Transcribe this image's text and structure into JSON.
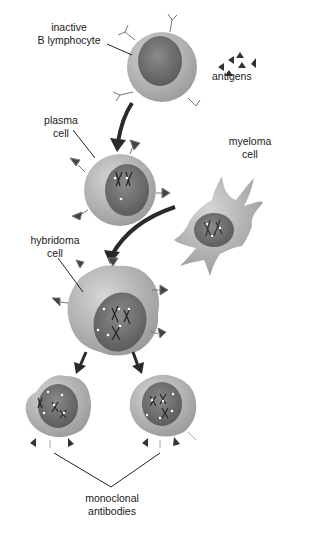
{
  "labels": {
    "inactive_b": [
      "inactive",
      "B lymphocyte"
    ],
    "antigens": "antigens",
    "plasma": [
      "plasma",
      "cell"
    ],
    "myeloma": [
      "myeloma",
      "cell"
    ],
    "hybridoma": [
      "hybridoma",
      "cell"
    ],
    "monoclonal": [
      "monoclonal",
      "antibodies"
    ]
  },
  "colors": {
    "cell_fill": "#b3b3b3",
    "cell_light": "#cfcfcf",
    "nucleus": "#6e6e6e",
    "arrow": "#2a2a2a",
    "line": "#222222"
  }
}
